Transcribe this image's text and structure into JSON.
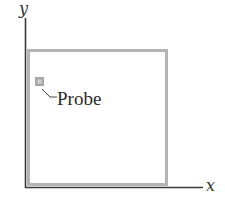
{
  "diagram": {
    "axes": {
      "x_label": "x",
      "y_label": "y",
      "color": "#3a3a3a"
    },
    "region": {
      "border_color": "#b4b4b4"
    },
    "probe": {
      "label": "Probe",
      "fill_color": "#a8a8a8",
      "inner_color": "#c8c8c8"
    }
  }
}
